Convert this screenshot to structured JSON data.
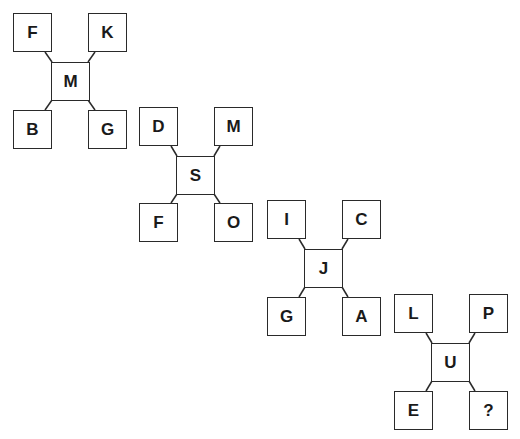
{
  "puzzle": {
    "groups": [
      {
        "center": "M",
        "top_left": "F",
        "top_right": "K",
        "bottom_left": "B",
        "bottom_right": "G"
      },
      {
        "center": "S",
        "top_left": "D",
        "top_right": "M",
        "bottom_left": "F",
        "bottom_right": "O"
      },
      {
        "center": "J",
        "top_left": "I",
        "top_right": "C",
        "bottom_left": "G",
        "bottom_right": "A"
      },
      {
        "center": "U",
        "top_left": "L",
        "top_right": "P",
        "bottom_left": "E",
        "bottom_right": "?"
      }
    ]
  }
}
